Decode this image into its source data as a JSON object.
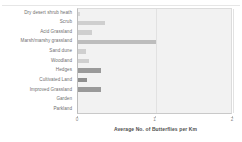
{
  "chart_data": {
    "type": "bar",
    "orientation": "horizontal",
    "title": "",
    "xlabel": "Average No. of Butterflies per Km",
    "ylabel": "",
    "xlim": [
      0,
      2
    ],
    "xticks": [
      0,
      1,
      2
    ],
    "xtick_labels": [
      "0",
      "1",
      "2"
    ],
    "grid": true,
    "legend": false,
    "categories": [
      "Dry desert shrub heath",
      "Scrub",
      "Acid Grassland",
      "Marsh/marshy grassland",
      "Sand dune",
      "Woodland",
      "Hedges",
      "Cultivated Land",
      "Improved Grassland",
      "Garden",
      "Parkland"
    ],
    "values": [
      0.02,
      0.35,
      0.18,
      1.0,
      0.1,
      0.14,
      0.3,
      0.12,
      0.3,
      0,
      0
    ],
    "bar_colors": [
      "#d6d6d6",
      "#cfcfcf",
      "#cfcfcf",
      "#bdbdbd",
      "#cfcfcf",
      "#cfcfcf",
      "#9a9a9a",
      "#8f8f8f",
      "#9a9a9a",
      "#f2f2f2",
      "#f2f2f2"
    ],
    "plot_background": "#f2f2f2",
    "grid_color": "#e2e2e2",
    "axis_color": "#bdbdbd",
    "label_color": "#6f6f6f"
  }
}
